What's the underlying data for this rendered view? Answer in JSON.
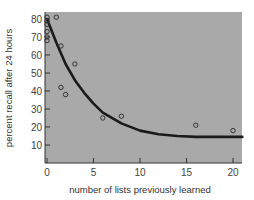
{
  "chart_data": {
    "type": "scatter",
    "title": "",
    "xlabel": "number of lists previously learned",
    "ylabel": "percent recall after 24 hours",
    "xlim": [
      0,
      21
    ],
    "ylim": [
      0,
      84
    ],
    "x_ticks": [
      0,
      5,
      10,
      15,
      20
    ],
    "y_ticks": [
      10,
      20,
      30,
      40,
      50,
      60,
      70,
      80
    ],
    "grid": false,
    "legend": null,
    "series": [
      {
        "name": "observed",
        "kind": "scatter",
        "points": [
          {
            "x": 0,
            "y": 81
          },
          {
            "x": 0,
            "y": 79
          },
          {
            "x": 0,
            "y": 77
          },
          {
            "x": 0,
            "y": 73
          },
          {
            "x": 0,
            "y": 70
          },
          {
            "x": 0,
            "y": 68
          },
          {
            "x": 1,
            "y": 81
          },
          {
            "x": 1.5,
            "y": 65
          },
          {
            "x": 3,
            "y": 55
          },
          {
            "x": 1.5,
            "y": 42
          },
          {
            "x": 2,
            "y": 38
          },
          {
            "x": 6,
            "y": 25
          },
          {
            "x": 8,
            "y": 26
          },
          {
            "x": 16,
            "y": 21
          },
          {
            "x": 20,
            "y": 18
          }
        ]
      },
      {
        "name": "fitted curve",
        "kind": "line",
        "points": [
          {
            "x": 0,
            "y": 80
          },
          {
            "x": 1,
            "y": 67
          },
          {
            "x": 2,
            "y": 55
          },
          {
            "x": 3,
            "y": 46
          },
          {
            "x": 4,
            "y": 39
          },
          {
            "x": 5,
            "y": 33
          },
          {
            "x": 6,
            "y": 28
          },
          {
            "x": 8,
            "y": 22
          },
          {
            "x": 10,
            "y": 18
          },
          {
            "x": 12,
            "y": 16
          },
          {
            "x": 14,
            "y": 15
          },
          {
            "x": 16,
            "y": 14.5
          },
          {
            "x": 18,
            "y": 14.5
          },
          {
            "x": 21,
            "y": 14.5
          }
        ]
      }
    ],
    "colors": {
      "plot_background": "#a9a9a9",
      "curve": "#1a1a1a",
      "marker": "#333333"
    }
  }
}
